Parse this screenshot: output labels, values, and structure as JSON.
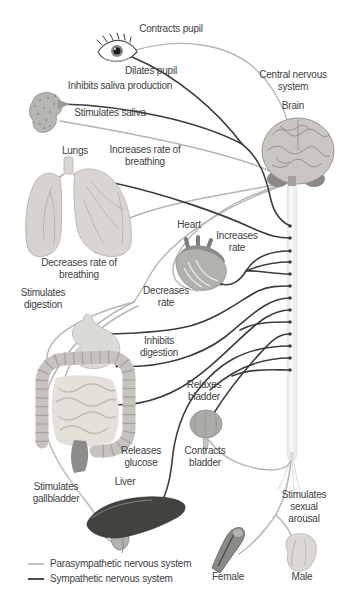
{
  "labels": {
    "contracts_pupil": "Contracts pupil",
    "dilates_pupil": "Dilates pupil",
    "central_nervous_system": "Central nervous system",
    "inhibits_saliva": "Inhibits saliva production",
    "brain": "Brain",
    "stimulates_saliva": "Stimulates saliva",
    "lungs": "Lungs",
    "increases_breathing": "Increases rate of breathing",
    "heart": "Heart",
    "increases_rate": "Increases rate",
    "decreases_breathing": "Decreases rate of breathing",
    "stimulates_digestion": "Stimulates digestion",
    "decreases_rate": "Decreases rate",
    "inhibits_digestion": "Inhibits digestion",
    "relaxes_bladder": "Relaxes bladder",
    "releases_glucose": "Releases glucose",
    "contracts_bladder": "Contracts bladder",
    "stimulates_gallbladder": "Stimulates gallbladder",
    "liver": "Liver",
    "stimulates_sexual_arousal": "Stimulates sexual arousal",
    "female": "Female",
    "male": "Male"
  },
  "legend": {
    "parasympathetic": "Parasympathetic nervous system",
    "sympathetic": "Sympathetic nervous system"
  },
  "colors": {
    "parasympathetic": "#b4b4b4",
    "sympathetic": "#3c3c3c",
    "text": "#3e3e3e"
  }
}
